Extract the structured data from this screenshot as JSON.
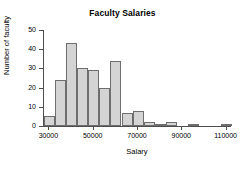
{
  "chart_data": {
    "type": "bar",
    "title": "Faculty Salaries",
    "xlabel": "Salary",
    "ylabel": "Number of faculty",
    "grid": false,
    "legend": null,
    "xlim": [
      28000,
      112000
    ],
    "ylim": [
      0,
      50
    ],
    "bin_width": 5000,
    "x_ticks": [
      30000,
      50000,
      70000,
      90000,
      110000
    ],
    "x_tick_labels": [
      "30000",
      "50000",
      "70000",
      "90000",
      "110000"
    ],
    "y_ticks": [
      0,
      10,
      20,
      30,
      40,
      50
    ],
    "y_tick_labels": [
      "0",
      "10",
      "20",
      "30",
      "40",
      "50"
    ],
    "bin_starts": [
      28000,
      33000,
      38000,
      43000,
      48000,
      53000,
      58000,
      63000,
      68000,
      73000,
      78000,
      83000,
      88000,
      93000,
      98000,
      103000,
      108000
    ],
    "categories": [
      "28000-33000",
      "33000-38000",
      "38000-43000",
      "43000-48000",
      "48000-53000",
      "53000-58000",
      "58000-63000",
      "63000-68000",
      "68000-73000",
      "73000-78000",
      "78000-83000",
      "83000-88000",
      "88000-93000",
      "93000-98000",
      "98000-103000",
      "103000-108000",
      "108000-113000"
    ],
    "values": [
      5,
      24,
      43,
      30,
      29,
      20,
      34,
      7,
      8,
      2,
      1,
      2,
      0,
      1,
      0,
      0,
      1
    ],
    "bar_color": "#d4d4d4",
    "bar_edge_color": "#6e6e6e",
    "axis_color": "#4d4d4d",
    "background": "#ffffff"
  }
}
